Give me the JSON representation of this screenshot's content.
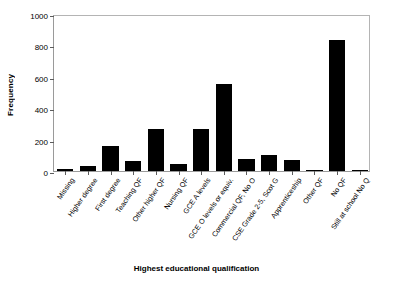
{
  "chart_data": {
    "type": "bar",
    "title": "",
    "xlabel": "Highest educational qualification",
    "ylabel": "Frequency",
    "ylim": [
      0,
      1000
    ],
    "yticks": [
      0,
      200,
      400,
      600,
      800,
      1000
    ],
    "grid": false,
    "legend": null,
    "bar_color": "#000000",
    "categories": [
      "Missing",
      "Higher degree",
      "First degree",
      "Teaching QF",
      "Other higher QF",
      "Nursing QF",
      "GCE A levels",
      "GCE O levels or equiv.",
      "Commercial QF, No O",
      "CSE Grade 2-5, Scot G",
      "Apprenticeship",
      "Other QF",
      "No QF",
      "Still at school No Q"
    ],
    "values": [
      10,
      32,
      160,
      64,
      270,
      44,
      270,
      553,
      78,
      102,
      71,
      8,
      835,
      6
    ]
  },
  "axis": {
    "y_title": "Frequency",
    "x_title": "Highest educational qualification",
    "y_tick_labels": [
      "0",
      "200",
      "400",
      "600",
      "800",
      "1000"
    ]
  }
}
